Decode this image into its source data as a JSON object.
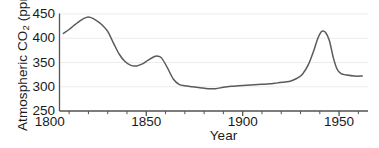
{
  "chart_data": {
    "type": "line",
    "title": "",
    "xlabel": "Year",
    "ylabel": "Atmospheric CO2 (ppm)",
    "ylabel_parts": {
      "prefix": "Atmospheric CO",
      "subscript": "2",
      "suffix": " (ppm)"
    },
    "xlim": [
      1805,
      1965
    ],
    "ylim": [
      250,
      450
    ],
    "yticks": [
      450,
      400,
      350,
      300,
      250
    ],
    "xticks": [
      1800,
      1850,
      1900,
      1950
    ],
    "x_minor_tick_interval": 10,
    "grid": "horizontal-major-light",
    "legend": "none",
    "line_color": "#5a5a5a",
    "axis_color": "#555555",
    "grid_color": "#ececec",
    "series": [
      {
        "name": "Atmospheric CO2",
        "x": [
          1807,
          1810,
          1813,
          1816,
          1819,
          1821,
          1824,
          1827,
          1830,
          1833,
          1836,
          1839,
          1842,
          1845,
          1848,
          1851,
          1854,
          1856,
          1858,
          1861,
          1864,
          1867,
          1870,
          1874,
          1878,
          1882,
          1886,
          1890,
          1894,
          1898,
          1902,
          1906,
          1910,
          1914,
          1918,
          1922,
          1925,
          1928,
          1931,
          1934,
          1937,
          1939,
          1941,
          1943,
          1945,
          1947,
          1949,
          1951,
          1954,
          1958,
          1962
        ],
        "values": [
          410,
          418,
          428,
          437,
          443,
          443,
          437,
          428,
          414,
          390,
          367,
          352,
          344,
          343,
          347,
          355,
          362,
          363,
          359,
          339,
          316,
          305,
          302,
          300,
          298,
          296,
          296,
          299,
          301,
          302,
          303,
          304,
          305,
          306,
          308,
          310,
          312,
          317,
          326,
          345,
          376,
          400,
          414,
          412,
          395,
          360,
          336,
          327,
          324,
          322,
          322
        ]
      }
    ]
  },
  "axes": {
    "y_title": "Atmospheric CO",
    "y_title_sub": "2",
    "y_title_unit": " (ppm)",
    "x_title": "Year"
  }
}
